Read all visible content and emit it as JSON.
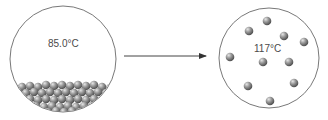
{
  "diagram": {
    "left_panel": {
      "temperature_label": "85.0°C",
      "state": "liquid"
    },
    "right_panel": {
      "temperature_label": "117°C",
      "state": "gas"
    },
    "arrow": {
      "direction": "right"
    },
    "colors": {
      "outline": "#555555",
      "particle": "#8a8a8a",
      "particle_highlight": "#d8d8d8",
      "particle_shadow": "#555555",
      "arrow": "#444444"
    }
  }
}
